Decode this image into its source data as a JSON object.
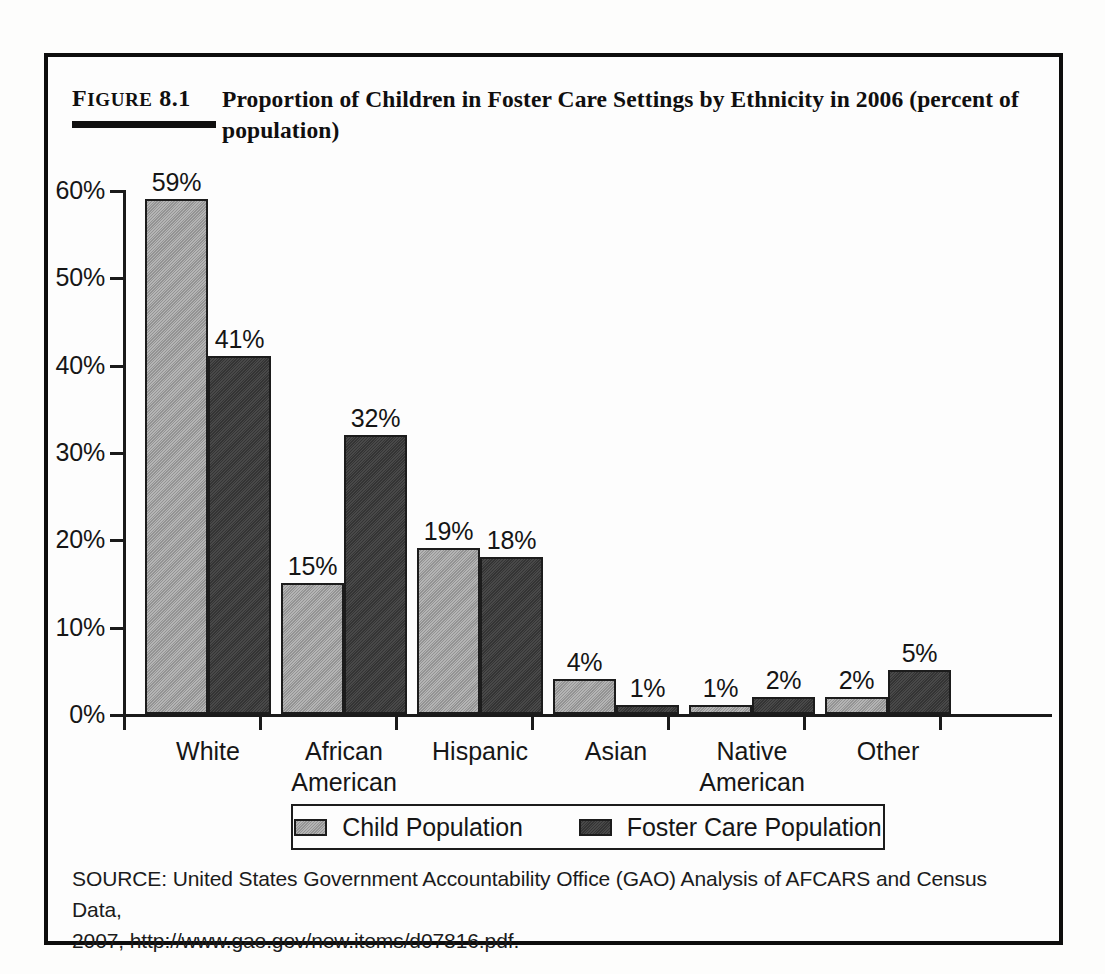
{
  "figure": {
    "label_prefix": "F",
    "label_word": "IGURE",
    "label_number": " 8.1",
    "title": "Proportion of Children in Foster Care Settings by Ethnicity in 2006 (percent of population)"
  },
  "source": {
    "line1": "SOURCE: United States Government Accountability Office (GAO) Analysis of AFCARS and Census Data,",
    "line2": "2007, http://www.gao.gov/new.items/d07816.pdf."
  },
  "legend": {
    "items": [
      {
        "label": "Child Population",
        "color": "#9b9b9b"
      },
      {
        "label": "Foster Care Population",
        "color": "#3b3b3b"
      }
    ]
  },
  "axis": {
    "y_ticks": [
      "60%",
      "50%",
      "40%",
      "30%",
      "20%",
      "10%",
      "0%"
    ]
  },
  "chart_data": {
    "type": "bar",
    "title": "Proportion of Children in Foster Care Settings by Ethnicity in 2006 (percent of population)",
    "xlabel": "",
    "ylabel": "",
    "ylim": [
      0,
      60
    ],
    "ytick_step": 10,
    "grid": false,
    "legend_position": "bottom",
    "units": "percent",
    "categories": [
      "White",
      "African American",
      "Hispanic",
      "Asian",
      "Native American",
      "Other"
    ],
    "category_lines": [
      [
        "White"
      ],
      [
        "African",
        "American"
      ],
      [
        "Hispanic"
      ],
      [
        "Asian"
      ],
      [
        "Native",
        "American"
      ],
      [
        "Other"
      ]
    ],
    "series": [
      {
        "name": "Child Population",
        "color": "#9b9b9b",
        "values": [
          59,
          15,
          19,
          4,
          1,
          2
        ],
        "labels": [
          "59%",
          "15%",
          "19%",
          "4%",
          "1%",
          "2%"
        ]
      },
      {
        "name": "Foster Care Population",
        "color": "#3b3b3b",
        "values": [
          41,
          32,
          18,
          1,
          2,
          5
        ],
        "labels": [
          "41%",
          "32%",
          "18%",
          "1%",
          "2%",
          "5%"
        ]
      }
    ]
  }
}
